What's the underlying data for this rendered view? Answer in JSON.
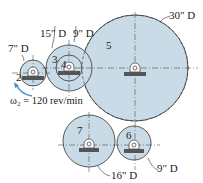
{
  "figure": {
    "gears": [
      {
        "id": "2",
        "label": "2",
        "diameter_label": "7\" D"
      },
      {
        "id": "3",
        "label": "3",
        "diameter_label": "15\" D"
      },
      {
        "id": "4",
        "label": "4",
        "diameter_label": "9\" D"
      },
      {
        "id": "5",
        "label": "5",
        "diameter_label": "30\" D"
      },
      {
        "id": "6",
        "label": "6",
        "diameter_label": "9\" D"
      },
      {
        "id": "7",
        "label": "7",
        "diameter_label": "16\" D"
      }
    ],
    "input_speed": "ω₂ = 120 rev/min",
    "colors": {
      "gear_fill": "#c9dbe6",
      "gear_stroke": "#333333",
      "arrow": "#4a90c8"
    }
  }
}
